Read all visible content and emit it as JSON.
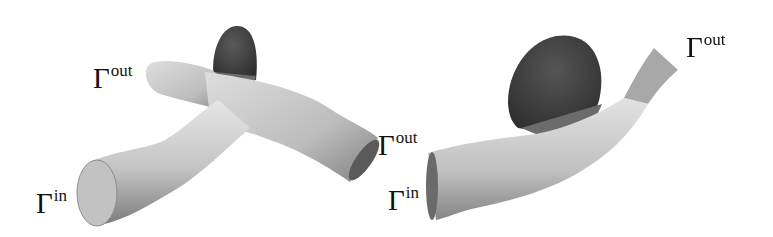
{
  "figure": {
    "panels": [
      {
        "id": "left",
        "description": "Bifurcating vessel geometry with aneurysm (dark) at the bifurcation",
        "labels": [
          {
            "symbol": "Γ",
            "superscript": "out",
            "role": "outlet-upper-left"
          },
          {
            "symbol": "Γ",
            "superscript": "out",
            "role": "outlet-right"
          },
          {
            "symbol": "Γ",
            "superscript": "in",
            "role": "inlet"
          }
        ]
      },
      {
        "id": "right",
        "description": "Curved vessel geometry with large sidewall aneurysm (dark)",
        "labels": [
          {
            "symbol": "Γ",
            "superscript": "out",
            "role": "outlet-upper-right"
          },
          {
            "symbol": "Γ",
            "superscript": "in",
            "role": "inlet"
          }
        ]
      }
    ],
    "colors": {
      "vessel_light": "#d8d8d8",
      "vessel_shadow": "#8a8a8a",
      "aneurysm": "#4a4a4a",
      "label_text": "#111111"
    }
  }
}
